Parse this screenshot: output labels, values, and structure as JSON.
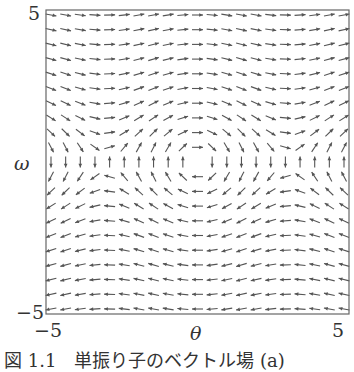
{
  "chart_data": {
    "type": "quiver",
    "title": "",
    "xlabel": "θ",
    "ylabel": "ω",
    "xlim": [
      -5,
      5
    ],
    "ylim": [
      -5,
      5
    ],
    "x_ticks": [
      "−5",
      "5"
    ],
    "y_ticks": [
      "5",
      "−5"
    ],
    "grid": false,
    "legend": null,
    "field": {
      "description": "Simple pendulum vector field, arrows normalized to unit length",
      "dtheta_dt": "ω",
      "domega_dt": "-sin(θ)",
      "normalized": true
    },
    "sample_grid": {
      "theta": [
        -5,
        -4.5,
        -4,
        -3.5,
        -3,
        -2.5,
        -2,
        -1.5,
        -1,
        -0.5,
        0,
        0.5,
        1,
        1.5,
        2,
        2.5,
        3,
        3.5,
        4,
        4.5,
        5
      ],
      "omega": [
        -5,
        -4.5,
        -4,
        -3.5,
        -3,
        -2.5,
        -2,
        -1.5,
        -1,
        -0.5,
        0,
        0.5,
        1,
        1.5,
        2,
        2.5,
        3,
        3.5,
        4,
        4.5,
        5
      ]
    },
    "annotations": [
      "zero vector at (θ, ω) = (0, 0)"
    ]
  },
  "figure": {
    "caption": "図 1.1　単振り子のベクトル場 (a)"
  },
  "colors": {
    "arrow": "#555555",
    "frame": "#666666",
    "text": "#333333"
  }
}
